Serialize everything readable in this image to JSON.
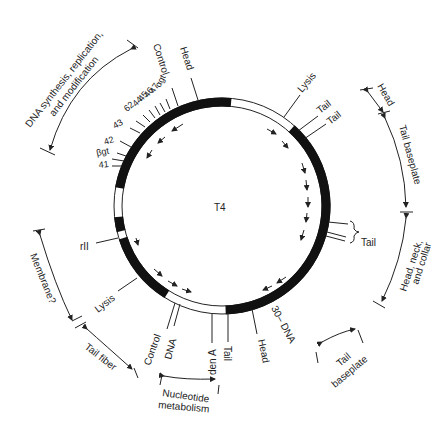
{
  "title": "T4",
  "genome_map": {
    "center_label": "T4",
    "gene_labels": {
      "head_top": "Head",
      "control_top": "Control",
      "agt": "αgt",
      "g47": "47",
      "g46": "46",
      "g45": "45",
      "g44": "44",
      "g62": "62",
      "g43": "43",
      "g42": "42",
      "bgt": "βgt",
      "g41": "41",
      "lysis_top": "Lysis",
      "tail_1": "Tail",
      "tail_2": "Tail",
      "tail_right": "Tail",
      "rII": "rII",
      "lysis_bottom": "Lysis",
      "control_bottom": "Control",
      "dna_bottom": "DNA",
      "denA": "den A",
      "tail_bottom": "Tail",
      "head_bottom": "Head",
      "g30_dna": "30– DNA"
    },
    "functional_regions": {
      "dna_synthesis_line1": "DNA synthesis, replication,",
      "dna_synthesis_line2": "and modification",
      "head": "Head",
      "tail_baseplate_right": "Tail baseplate",
      "head_neck_line1": "Head, neck,",
      "head_neck_line2": "and collar",
      "tail_baseplate_bottom_line1": "Tail",
      "tail_baseplate_bottom_line2": "baseplate",
      "nucleotide_line1": "Nucleotide",
      "nucleotide_line2": "metabolism",
      "tail_fiber": "Tail fiber",
      "membrane": "Membrane?"
    }
  }
}
